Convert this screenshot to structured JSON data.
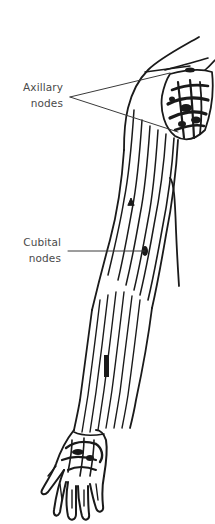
{
  "diagram": {
    "colors": {
      "line": "#1a1a1a",
      "label_text": "#4a4a4a",
      "leader_line": "#3a3a3a",
      "background": "#ffffff"
    },
    "labels": [
      {
        "id": "axillary",
        "lines": [
          "Axillary",
          "nodes"
        ],
        "leader_count": 2,
        "target": "axillary lymph node cluster near shoulder/armpit"
      },
      {
        "id": "cubital",
        "lines": [
          "Cubital",
          "nodes"
        ],
        "leader_count": 1,
        "target": "cubital lymph node at elbow"
      }
    ],
    "parts": [
      "shoulder",
      "axilla",
      "upper-arm",
      "elbow",
      "forearm",
      "hand"
    ]
  }
}
